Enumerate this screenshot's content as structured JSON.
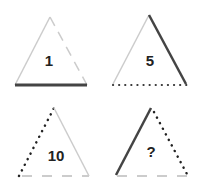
{
  "puzzle": {
    "colors": {
      "dark": "#444444",
      "light": "#cccccc"
    },
    "triangles": [
      {
        "label": "1",
        "left": "solid-light",
        "right": "dashed-light",
        "bottom": "solid-dark"
      },
      {
        "label": "5",
        "left": "solid-light",
        "right": "solid-dark",
        "bottom": "dotted-dark"
      },
      {
        "label": "10",
        "left": "dotted-dark",
        "right": "solid-light",
        "bottom": "dashed-light"
      },
      {
        "label": "?",
        "left": "solid-dark",
        "right": "dotted-dark",
        "bottom": "dashed-light"
      }
    ]
  }
}
